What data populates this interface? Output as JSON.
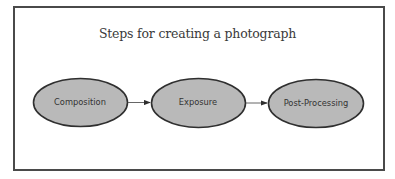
{
  "diagram": {
    "title": "Steps for creating a photograph",
    "nodes": [
      {
        "id": "composition",
        "label": "Composition"
      },
      {
        "id": "exposure",
        "label": "Exposure"
      },
      {
        "id": "post-processing",
        "label": "Post-Processing"
      }
    ],
    "edges": [
      {
        "from": "composition",
        "to": "exposure"
      },
      {
        "from": "exposure",
        "to": "post-processing"
      }
    ],
    "colors": {
      "node_fill": "#b9b9b9",
      "node_stroke": "#2f2f2f",
      "frame": "#4a4a4a",
      "text": "#333333"
    }
  }
}
